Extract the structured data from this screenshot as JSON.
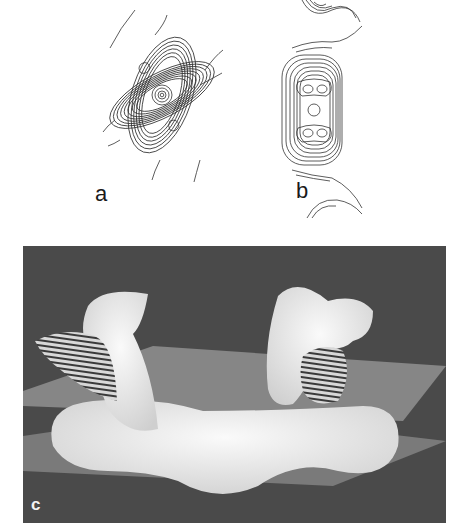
{
  "figure": {
    "panels": [
      {
        "id": "a",
        "label": "a",
        "type": "contour-map",
        "description": "Density contour map, single diagonal molecule with central ring peak and two side peaks"
      },
      {
        "id": "b",
        "label": "b",
        "type": "contour-map",
        "description": "Density contour map, vertical stacked cross-section with three-lobed core"
      },
      {
        "id": "c",
        "label": "c",
        "type": "3d-surface-render",
        "description": "3D rendered surface with two upright lobes cut by hatched planes above a curved base, two translucent slicing planes"
      }
    ]
  },
  "colors": {
    "background": "#ffffff",
    "contour_line": "#333333",
    "render_background": "#4a4a4a",
    "plane_light": "#8a8a8a",
    "plane_mid": "#6e6e6e",
    "surface": "#f0f0f0",
    "hatch": "#3a3a3a",
    "label_dark": "#1a1a1a",
    "label_light": "#f2f2f2"
  }
}
